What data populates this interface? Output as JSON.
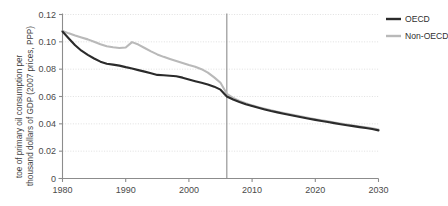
{
  "chart_data": {
    "type": "line",
    "title": "",
    "subtitle": "",
    "xlabel": "",
    "ylabel_line1": "toe of primary oil consumption per",
    "ylabel_line2": "thousand dollars of GDP (2007 prices, PPP)",
    "xlim": [
      1980,
      2030
    ],
    "ylim": [
      0,
      0.12
    ],
    "grid": true,
    "grid_axis": "y",
    "legend_position": "top-right",
    "xticks": [
      "1980",
      "1990",
      "2000",
      "2010",
      "2020",
      "2030"
    ],
    "xtick_values": [
      1980,
      1990,
      2000,
      2010,
      2020,
      2030
    ],
    "yticks": [
      "0",
      "0.02",
      "0.04",
      "0.06",
      "0.08",
      "0.10",
      "0.12"
    ],
    "ytick_values": [
      0,
      0.02,
      0.04,
      0.06,
      0.08,
      0.1,
      0.12
    ],
    "annotations": [
      {
        "name": "history-projection-divider",
        "type": "vline",
        "x": 2006,
        "label": ""
      }
    ],
    "x": [
      1980,
      1981,
      1982,
      1983,
      1984,
      1985,
      1986,
      1987,
      1988,
      1989,
      1990,
      1991,
      1992,
      1993,
      1994,
      1995,
      1996,
      1997,
      1998,
      1999,
      2000,
      2001,
      2002,
      2003,
      2004,
      2005,
      2006,
      2007,
      2008,
      2009,
      2010,
      2011,
      2012,
      2013,
      2014,
      2015,
      2016,
      2017,
      2018,
      2019,
      2020,
      2021,
      2022,
      2023,
      2024,
      2025,
      2026,
      2027,
      2028,
      2029,
      2030
    ],
    "series": [
      {
        "name": "OECD",
        "color": "#2b2b2b",
        "values": [
          0.1075,
          0.1025,
          0.0975,
          0.0935,
          0.0905,
          0.0878,
          0.0855,
          0.084,
          0.0833,
          0.0826,
          0.0815,
          0.0805,
          0.0793,
          0.0782,
          0.077,
          0.0758,
          0.0755,
          0.0752,
          0.0748,
          0.0738,
          0.0725,
          0.0712,
          0.07,
          0.0688,
          0.0672,
          0.065,
          0.06,
          0.0578,
          0.056,
          0.0544,
          0.053,
          0.0517,
          0.0505,
          0.0494,
          0.0484,
          0.0474,
          0.0464,
          0.0455,
          0.0446,
          0.0437,
          0.0429,
          0.0421,
          0.0413,
          0.0405,
          0.0397,
          0.039,
          0.0383,
          0.0376,
          0.0369,
          0.0362,
          0.0352
        ]
      },
      {
        "name": "Non-OECD",
        "color": "#b9b9b9",
        "values": [
          0.108,
          0.1062,
          0.1046,
          0.1032,
          0.1018,
          0.1,
          0.0982,
          0.0968,
          0.096,
          0.0955,
          0.0958,
          0.0998,
          0.098,
          0.0955,
          0.093,
          0.0908,
          0.089,
          0.0875,
          0.086,
          0.0845,
          0.083,
          0.0818,
          0.08,
          0.0775,
          0.074,
          0.07,
          0.062,
          0.059,
          0.0568,
          0.055,
          0.0535,
          0.0522,
          0.051,
          0.0499,
          0.0489,
          0.0479,
          0.0469,
          0.046,
          0.0451,
          0.0442,
          0.0434,
          0.0426,
          0.0418,
          0.041,
          0.0402,
          0.0395,
          0.0388,
          0.0381,
          0.0374,
          0.0367,
          0.0358
        ]
      }
    ],
    "legend": [
      {
        "label": "OECD",
        "color": "#2b2b2b"
      },
      {
        "label": "Non-OECD",
        "color": "#b9b9b9"
      }
    ]
  },
  "style": {
    "axis_color": "#8c8c8c",
    "grid_color": "#d8d8d8",
    "divider_color": "#8c8c8c",
    "background": "#ffffff"
  }
}
